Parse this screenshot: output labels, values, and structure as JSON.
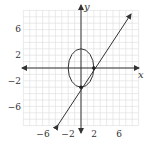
{
  "chart_data": {
    "type": "line",
    "title": "",
    "xlabel": "x",
    "ylabel": "y",
    "xlim": [
      -9,
      9
    ],
    "ylim": [
      -9,
      9
    ],
    "grid": true,
    "x_ticks": [
      -6,
      -2,
      2,
      6
    ],
    "y_ticks": [
      6,
      2,
      -2,
      -6
    ],
    "x_tick_labels": [
      "−6",
      "−2",
      "2",
      "6"
    ],
    "y_tick_labels": [
      "6",
      "2",
      "−2",
      "−6"
    ],
    "series": [
      {
        "name": "ellipse",
        "shape": "ellipse",
        "center": [
          0,
          0
        ],
        "semi_axis_x": 2,
        "semi_axis_y": 3,
        "equation": "x^2/4 + y^2/9 = 1"
      },
      {
        "name": "line",
        "shape": "line",
        "slope": 1.5,
        "intercept": -3,
        "equation": "y = 1.5x - 3",
        "arrows": "both"
      }
    ],
    "points": [
      {
        "x": 2,
        "y": 0
      },
      {
        "x": 0,
        "y": -3
      }
    ]
  },
  "labels": {
    "x_axis": "x",
    "y_axis": "y",
    "xt0": "−6",
    "xt1": "−2",
    "xt2": "2",
    "xt3": "6",
    "yt0": "6",
    "yt1": "2",
    "yt2": "−2",
    "yt3": "−6"
  },
  "colors": {
    "grid": "#dcdcdc",
    "axis": "#333333",
    "curve": "#333333"
  }
}
